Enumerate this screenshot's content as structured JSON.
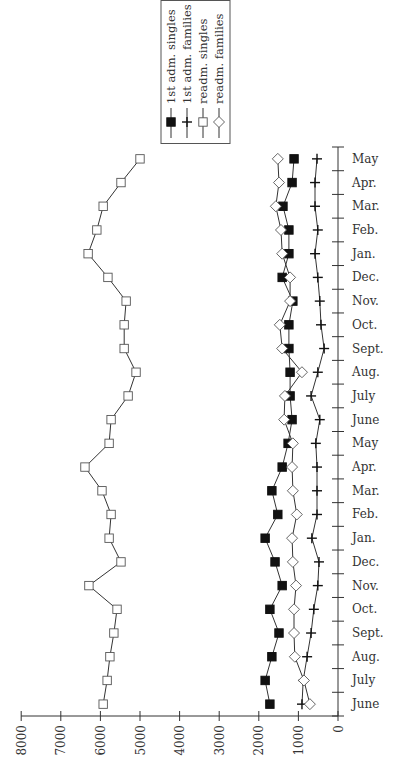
{
  "chart_data": {
    "type": "line",
    "orientation": "rotated-90 (value axis horizontal at bottom, increasing right-to-left; months vertical, June at bottom to May at top)",
    "title": "",
    "xlabel": "",
    "ylabel": "",
    "value_axis": {
      "range": [
        0,
        8000
      ],
      "ticks": [
        "0",
        "1000",
        "2000",
        "3000",
        "4000",
        "5000",
        "6000",
        "7000",
        "8000"
      ]
    },
    "categories": [
      "June",
      "July",
      "Aug.",
      "Sept.",
      "Oct.",
      "Nov.",
      "Dec.",
      "Jan.",
      "Feb.",
      "Mar.",
      "Apr.",
      "May",
      "June",
      "July",
      "Aug.",
      "Sept.",
      "Oct.",
      "Nov.",
      "Dec.",
      "Jan.",
      "Feb.",
      "Mar.",
      "Apr.",
      "May"
    ],
    "series": [
      {
        "name": "1st adm. singles",
        "marker": "filled-square",
        "values": [
          1720,
          1840,
          1670,
          1490,
          1720,
          1410,
          1590,
          1840,
          1520,
          1670,
          1410,
          1260,
          1160,
          1210,
          1210,
          1240,
          1240,
          1140,
          1410,
          1240,
          1240,
          1390,
          1160,
          1110
        ]
      },
      {
        "name": "1st adm. families",
        "marker": "plus",
        "values": [
          910,
          880,
          780,
          680,
          610,
          510,
          480,
          660,
          530,
          530,
          530,
          560,
          460,
          680,
          510,
          350,
          430,
          460,
          510,
          580,
          510,
          580,
          580,
          530
        ]
      },
      {
        "name": "readm. singles",
        "marker": "open-square",
        "values": [
          5930,
          5830,
          5760,
          5660,
          5580,
          6290,
          5480,
          5780,
          5730,
          5960,
          6390,
          5780,
          5730,
          5300,
          5100,
          5400,
          5400,
          5350,
          5810,
          6310,
          6090,
          5930,
          5480,
          5000
        ]
      },
      {
        "name": "readm. families",
        "marker": "open-diamond",
        "values": [
          710,
          860,
          1090,
          1110,
          1110,
          1060,
          1140,
          1160,
          1040,
          1140,
          1160,
          1140,
          1360,
          1340,
          910,
          1410,
          1470,
          1210,
          1210,
          1410,
          1440,
          1570,
          1490,
          1520
        ]
      }
    ],
    "legend": {
      "position": "top-center (boxed, rotated)",
      "entries": [
        "1st adm. singles",
        "1st adm. families",
        "readm. singles",
        "readm. families"
      ]
    },
    "grid": false
  }
}
